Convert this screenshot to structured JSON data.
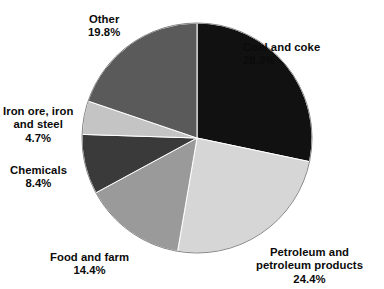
{
  "figure": {
    "background_color": "#ffffff",
    "bottom_caption": ""
  },
  "chart_data": {
    "type": "pie",
    "title": "",
    "subtitle": "",
    "xlabel": "",
    "ylabel": "",
    "grid": false,
    "legend_position": "none",
    "label_style": "outside-callout-text",
    "start_angle_deg": 0,
    "direction": "clockwise",
    "center": {
      "x": 197,
      "y": 138
    },
    "radius": 115,
    "units": "percent",
    "total": 100.0,
    "categories": [
      "Coal and coke",
      "Petroleum and petroleum products",
      "Food and farm",
      "Chemicals",
      "Iron ore, iron and steel",
      "Other"
    ],
    "values": [
      28.3,
      24.4,
      14.4,
      8.4,
      4.7,
      19.8
    ],
    "colors": [
      "#111111",
      "#d6d6d6",
      "#9a9a9a",
      "#3a3a3a",
      "#c4c4c4",
      "#5a5a5a"
    ],
    "slices": [
      {
        "key": "coal",
        "label_line1": "Coal and coke",
        "label_line2": "",
        "label_line3": "",
        "percent_text": "28.3%",
        "value": 28.3,
        "color": "#111111"
      },
      {
        "key": "petroleum",
        "label_line1": "Petroleum and",
        "label_line2": "petroleum products",
        "label_line3": "",
        "percent_text": "24.4%",
        "value": 24.4,
        "color": "#d6d6d6"
      },
      {
        "key": "food",
        "label_line1": "Food and farm",
        "label_line2": "",
        "label_line3": "",
        "percent_text": "14.4%",
        "value": 14.4,
        "color": "#9a9a9a"
      },
      {
        "key": "chemicals",
        "label_line1": "Chemicals",
        "label_line2": "",
        "label_line3": "",
        "percent_text": "8.4%",
        "value": 8.4,
        "color": "#3a3a3a"
      },
      {
        "key": "ironore",
        "label_line1": "Iron ore, iron",
        "label_line2": "and steel",
        "label_line3": "",
        "percent_text": "4.7%",
        "value": 4.7,
        "color": "#c4c4c4"
      },
      {
        "key": "other",
        "label_line1": "Other",
        "label_line2": "",
        "label_line3": "",
        "percent_text": "19.8%",
        "value": 19.8,
        "color": "#5a5a5a"
      }
    ]
  }
}
